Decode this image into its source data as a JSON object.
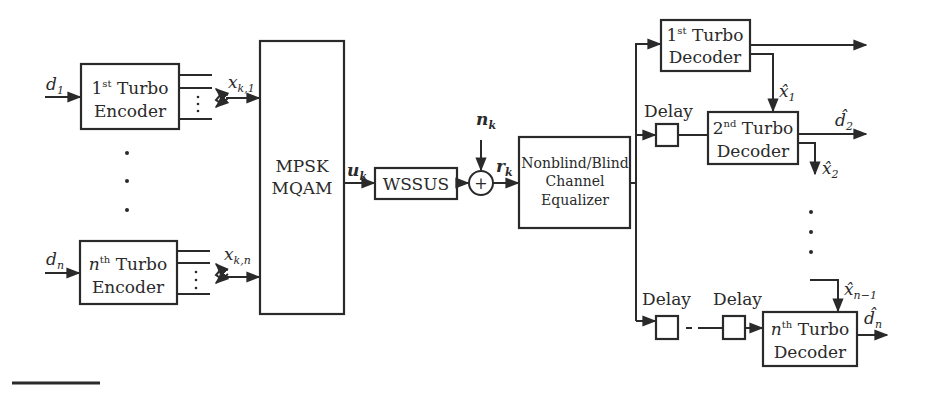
{
  "diagram": {
    "type": "block-diagram",
    "title": "",
    "encoders": [
      {
        "input": "d",
        "input_sub": "1",
        "ordinal": "1",
        "ordinal_sup": "st",
        "line1_rest": " Turbo",
        "line2": "Encoder",
        "output": "x",
        "output_sub": "k,1"
      },
      {
        "input": "d",
        "input_sub": "n",
        "ordinal": "n",
        "ordinal_sup": "th",
        "line1_rest": " Turbo",
        "line2": "Encoder",
        "output": "x",
        "output_sub": "k,n"
      }
    ],
    "modulator": {
      "line1": "MPSK",
      "line2": "MQAM",
      "output": "u",
      "output_sub": "k"
    },
    "channel": {
      "label": "WSSUS"
    },
    "adder": {
      "symbol": "+",
      "noise": "n",
      "noise_sub": "k",
      "output": "r",
      "output_sub": "k"
    },
    "equalizer": {
      "line1": "Nonblind/Blind",
      "line2": "Channel",
      "line3": "Equalizer"
    },
    "delay_label": "Delay",
    "decoders": [
      {
        "ordinal": "1",
        "ordinal_sup": "st",
        "line1_rest": " Turbo",
        "line2": "Decoder",
        "feedback": "x̂",
        "feedback_sub": "1"
      },
      {
        "ordinal": "2",
        "ordinal_sup": "nd",
        "line1_rest": " Turbo",
        "line2": "Decoder",
        "output": "d̂",
        "output_sub": "2",
        "feedback": "x̂",
        "feedback_sub": "2"
      },
      {
        "ordinal": "n",
        "ordinal_sup": "th",
        "line1_rest": " Turbo",
        "line2": "Decoder",
        "output": "d̂",
        "output_sub": "n",
        "feedback_in": "x̂",
        "feedback_in_sub": "n−1"
      }
    ],
    "ellipsis": "⋮"
  }
}
